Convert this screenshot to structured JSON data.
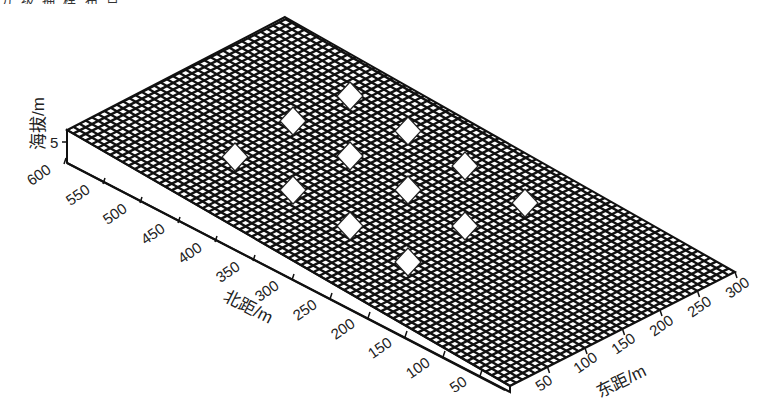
{
  "figure": {
    "caption_partial": "分 级 抽 样 布 点"
  },
  "chart_data": {
    "type": "surface3d",
    "title": "",
    "xlabel": "东距/m",
    "ylabel": "北距/m",
    "zlabel": "海拔/m",
    "x_ticks": [
      "50",
      "100",
      "150",
      "200",
      "250",
      "300"
    ],
    "y_ticks": [
      "50",
      "100",
      "150",
      "200",
      "250",
      "300",
      "350",
      "400",
      "450",
      "500",
      "550",
      "600"
    ],
    "z_ticks": [
      "5"
    ],
    "x_range": [
      0,
      300
    ],
    "y_range": [
      0,
      600
    ],
    "grid": true,
    "sample_points": [
      {
        "east": 200,
        "north": 500
      },
      {
        "east": 100,
        "north": 500
      },
      {
        "east": 250,
        "north": 400
      },
      {
        "east": 50,
        "north": 400
      },
      {
        "east": 150,
        "north": 400
      },
      {
        "east": 250,
        "north": 300
      },
      {
        "east": 100,
        "north": 300
      },
      {
        "east": 200,
        "north": 300
      },
      {
        "east": 250,
        "north": 200
      },
      {
        "east": 150,
        "north": 200
      },
      {
        "east": 200,
        "north": 150
      },
      {
        "east": 150,
        "north": 100
      }
    ]
  },
  "axes": {
    "z_label": "海拔/m",
    "z_tick": "5",
    "y_label": "北距/m",
    "x_label": "东距/m",
    "y_ticks": [
      {
        "label": "600",
        "x": 52,
        "y": 172
      },
      {
        "label": "550",
        "x": 91,
        "y": 192
      },
      {
        "label": "500",
        "x": 128,
        "y": 211
      },
      {
        "label": "450",
        "x": 166,
        "y": 231
      },
      {
        "label": "400",
        "x": 203,
        "y": 250
      },
      {
        "label": "350",
        "x": 241,
        "y": 269
      },
      {
        "label": "300",
        "x": 280,
        "y": 288
      },
      {
        "label": "250",
        "x": 318,
        "y": 307
      },
      {
        "label": "200",
        "x": 356,
        "y": 326
      },
      {
        "label": "150",
        "x": 393,
        "y": 345
      },
      {
        "label": "100",
        "x": 431,
        "y": 365
      },
      {
        "label": "50",
        "x": 468,
        "y": 384
      }
    ],
    "x_ticks": [
      {
        "label": "50",
        "x": 540,
        "y": 392
      },
      {
        "label": "100",
        "x": 578,
        "y": 374
      },
      {
        "label": "150",
        "x": 616,
        "y": 355
      },
      {
        "label": "200",
        "x": 654,
        "y": 337
      },
      {
        "label": "250",
        "x": 692,
        "y": 318
      },
      {
        "label": "300",
        "x": 730,
        "y": 299
      }
    ]
  },
  "colors": {
    "mesh": "#111111",
    "background": "#ffffff",
    "diamond": "#ffffff"
  }
}
